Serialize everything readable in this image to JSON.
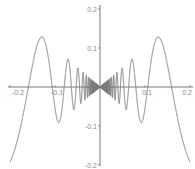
{
  "chart_data": {
    "type": "line",
    "title": "",
    "function": "y = x·sin(1/x)",
    "xlabel": "",
    "ylabel": "",
    "xlim": [
      -0.2,
      0.2
    ],
    "ylim": [
      -0.2,
      0.2
    ],
    "grid": false,
    "legend": null,
    "x_ticks": [
      {
        "value": -0.2,
        "label": "-0.2"
      },
      {
        "value": -0.1,
        "label": "-0.1"
      },
      {
        "value": 0.1,
        "label": "0.1"
      },
      {
        "value": 0.2,
        "label": "0.2"
      }
    ],
    "y_ticks": [
      {
        "value": 0.2,
        "label": "0.2"
      },
      {
        "value": 0.1,
        "label": "0.1"
      },
      {
        "value": -0.1,
        "label": "-0.1"
      },
      {
        "value": -0.2,
        "label": "-0.2"
      }
    ],
    "series": [
      {
        "name": "x·sin(1/x)",
        "color": "#7a7a7a",
        "x": [
          -0.2,
          -0.18,
          -0.16,
          -0.13,
          -0.106,
          -0.09,
          -0.0796,
          -0.07,
          -0.0637,
          -0.05,
          -0.04,
          -0.03,
          -0.02,
          -0.01,
          0,
          0.01,
          0.02,
          0.03,
          0.04,
          0.05,
          0.0637,
          0.07,
          0.0796,
          0.09,
          0.106,
          0.13,
          0.16,
          0.18,
          0.2
        ],
        "y": [
          -0.192,
          -0.121,
          -0.0,
          0.129,
          0.0,
          -0.09,
          0.0,
          0.068,
          0.0,
          0.046,
          -0.005,
          0.03,
          -0.005,
          0.005,
          0,
          0.005,
          -0.005,
          0.03,
          -0.005,
          0.046,
          0.0,
          0.068,
          0.0,
          -0.09,
          0.0,
          0.129,
          0.0,
          -0.121,
          -0.192
        ]
      }
    ],
    "colors": {
      "axis": "#555555",
      "curve": "#7a7a7a",
      "tick_label": "#8a8a8a"
    }
  }
}
